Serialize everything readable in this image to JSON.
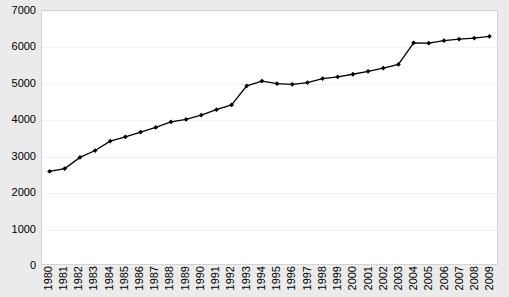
{
  "chart_data": {
    "type": "line",
    "title": "",
    "subtitle": "",
    "xlabel": "",
    "ylabel": "",
    "ylim": [
      0,
      7000
    ],
    "ytick_step": 1000,
    "yticks": [
      0,
      1000,
      2000,
      3000,
      4000,
      5000,
      6000,
      7000
    ],
    "ytick_labels": [
      "0",
      "1000",
      "2000",
      "3000",
      "4000",
      "5000",
      "6000",
      "7000"
    ],
    "grid": true,
    "legend": null,
    "legend_position": "none",
    "marker": "diamond",
    "line_color": "#000000",
    "marker_color": "#000000",
    "plot_background": "#ffffff",
    "figure_background": "#ebebeb",
    "gridline_color": "#f2f2f2",
    "border_color": "#d4d4d4",
    "categories": [
      "1980",
      "1981",
      "1982",
      "1983",
      "1984",
      "1985",
      "1986",
      "1987",
      "1988",
      "1989",
      "1990",
      "1991",
      "1992",
      "1993",
      "1994",
      "1995",
      "1996",
      "1997",
      "1998",
      "1999",
      "2000",
      "2001",
      "2002",
      "2003",
      "2004",
      "2005",
      "2006",
      "2007",
      "2008",
      "2009"
    ],
    "series": [
      {
        "name": "value",
        "values": [
          2560,
          2640,
          2950,
          3140,
          3400,
          3520,
          3650,
          3780,
          3930,
          4000,
          4120,
          4270,
          4400,
          4930,
          5060,
          4990,
          4970,
          5020,
          5130,
          5180,
          5250,
          5330,
          5420,
          5520,
          6120,
          6110,
          6180,
          6220,
          6250,
          6300
        ]
      }
    ]
  }
}
